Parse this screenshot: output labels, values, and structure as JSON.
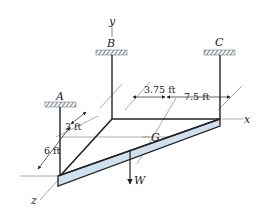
{
  "figure": {
    "type": "3D statics diagram"
  },
  "supports": [
    {
      "id": "A",
      "label": "A"
    },
    {
      "id": "B",
      "label": "B"
    },
    {
      "id": "C",
      "label": "C"
    }
  ],
  "axes": {
    "x": "x",
    "y": "y",
    "z": "z"
  },
  "points": {
    "centroid": "G"
  },
  "load": {
    "label": "W"
  },
  "dimensions": {
    "d1": "3.75 ft",
    "d2": "7.5 ft",
    "d3": "3 ft",
    "d4": "6 ft"
  },
  "colors": {
    "plate_fill": "#cfe0ee",
    "line": "#222222",
    "hatch": "#6f7d88"
  }
}
